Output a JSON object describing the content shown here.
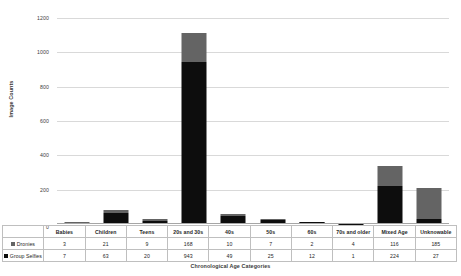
{
  "chart_data": {
    "type": "bar",
    "stacked": true,
    "title": "",
    "xlabel": "Chronological Age Categories",
    "ylabel": "Image Counts",
    "ylim": [
      0,
      1200
    ],
    "yticks": [
      0,
      200,
      400,
      600,
      800,
      1000,
      1200
    ],
    "grid": true,
    "legend_position": "table-row-headers",
    "categories": [
      "Babies",
      "Children",
      "Teens",
      "20s and 30s",
      "40s",
      "50s",
      "60s",
      "70s and older",
      "Mixed Age",
      "Unknowable"
    ],
    "series": [
      {
        "name": "Dronies",
        "color": "#646464",
        "stack_position": "top",
        "values": [
          3,
          21,
          9,
          168,
          10,
          7,
          2,
          4,
          116,
          185
        ]
      },
      {
        "name": "Group Selfies",
        "color": "#0d0d0d",
        "stack_position": "bottom",
        "values": [
          7,
          63,
          20,
          943,
          49,
          25,
          12,
          1,
          224,
          27
        ]
      }
    ],
    "totals": [
      10,
      84,
      29,
      1111,
      59,
      32,
      14,
      5,
      340,
      212
    ]
  },
  "axis": {
    "y_title": "Image Counts",
    "x_title": "Chronological Age Categories",
    "y_tick_labels": [
      "1200",
      "1000",
      "800",
      "600",
      "400",
      "200",
      "0"
    ]
  },
  "table": {
    "column_headers": [
      "Babies",
      "Children",
      "Teens",
      "20s and 30s",
      "40s",
      "50s",
      "60s",
      "70s and older",
      "Mixed Age",
      "Unknowable"
    ],
    "rows": [
      {
        "label": "Dronies",
        "marker_color": "#646464",
        "values": [
          "3",
          "21",
          "9",
          "168",
          "10",
          "7",
          "2",
          "4",
          "116",
          "185"
        ]
      },
      {
        "label": "Group Selfies",
        "marker_color": "#0d0d0d",
        "values": [
          "7",
          "63",
          "20",
          "943",
          "49",
          "25",
          "12",
          "1",
          "224",
          "27"
        ]
      }
    ]
  }
}
